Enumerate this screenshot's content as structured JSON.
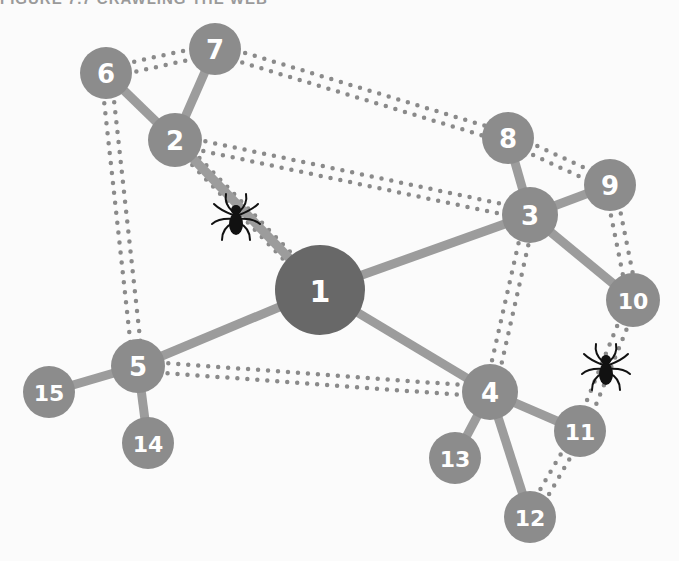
{
  "title": "FIGURE 7.7 CRAWLING THE WEB",
  "colors": {
    "background": "#fbfbfb",
    "node": "#8c8c8c",
    "root_node": "#686868",
    "edge": "#9c9c9c",
    "dotted_edge": "#8a8a8a",
    "spider": "#111111",
    "label": "#ffffff"
  },
  "nodes": [
    {
      "id": "1",
      "x": 320,
      "y": 290,
      "r": 45,
      "root": true
    },
    {
      "id": "2",
      "x": 175,
      "y": 140,
      "r": 27
    },
    {
      "id": "3",
      "x": 530,
      "y": 215,
      "r": 28
    },
    {
      "id": "4",
      "x": 490,
      "y": 392,
      "r": 28
    },
    {
      "id": "5",
      "x": 138,
      "y": 366,
      "r": 27
    },
    {
      "id": "6",
      "x": 106,
      "y": 73,
      "r": 26
    },
    {
      "id": "7",
      "x": 215,
      "y": 49,
      "r": 26
    },
    {
      "id": "8",
      "x": 508,
      "y": 138,
      "r": 26
    },
    {
      "id": "9",
      "x": 610,
      "y": 185,
      "r": 26
    },
    {
      "id": "10",
      "x": 633,
      "y": 300,
      "r": 27
    },
    {
      "id": "11",
      "x": 580,
      "y": 431,
      "r": 26
    },
    {
      "id": "12",
      "x": 530,
      "y": 517,
      "r": 26
    },
    {
      "id": "13",
      "x": 455,
      "y": 458,
      "r": 26
    },
    {
      "id": "14",
      "x": 148,
      "y": 443,
      "r": 26
    },
    {
      "id": "15",
      "x": 49,
      "y": 392,
      "r": 26
    }
  ],
  "edges_solid": [
    [
      "1",
      "2"
    ],
    [
      "1",
      "3"
    ],
    [
      "1",
      "4"
    ],
    [
      "1",
      "5"
    ],
    [
      "2",
      "6"
    ],
    [
      "2",
      "7"
    ],
    [
      "3",
      "8"
    ],
    [
      "3",
      "9"
    ],
    [
      "3",
      "10"
    ],
    [
      "4",
      "11"
    ],
    [
      "4",
      "12"
    ],
    [
      "4",
      "13"
    ],
    [
      "5",
      "14"
    ],
    [
      "5",
      "15"
    ]
  ],
  "edges_dotted": [
    [
      "6",
      "7"
    ],
    [
      "6",
      "5"
    ],
    [
      "7",
      "8"
    ],
    [
      "2",
      "3"
    ],
    [
      "2",
      "1"
    ],
    [
      "8",
      "9"
    ],
    [
      "9",
      "10"
    ],
    [
      "3",
      "4"
    ],
    [
      "5",
      "4"
    ],
    [
      "10",
      "11"
    ],
    [
      "11",
      "12"
    ]
  ],
  "spiders": [
    {
      "name": "spider-crawler-1",
      "x": 236,
      "y": 218
    },
    {
      "name": "spider-crawler-2",
      "x": 606,
      "y": 368
    }
  ]
}
